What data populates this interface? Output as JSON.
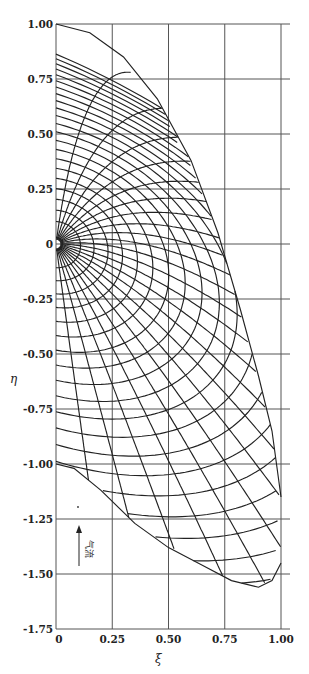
{
  "chart_data": {
    "type": "line",
    "title": "",
    "xlabel": "ξ",
    "ylabel": "η",
    "xlim": [
      0,
      1.0
    ],
    "ylim": [
      -1.75,
      1.0
    ],
    "grid": true,
    "x_ticks": [
      "0",
      "0.25",
      "0.50",
      "0.75",
      "1.00"
    ],
    "x_tick_values": [
      0,
      0.25,
      0.5,
      0.75,
      1.0
    ],
    "y_ticks": [
      "1.00",
      "0.75",
      "0.50",
      "0.25",
      "0",
      "-0.25",
      "-0.50",
      "-0.75",
      "-1.00",
      "-1.25",
      "-1.50",
      "-1.75"
    ],
    "y_tick_values": [
      1.0,
      0.75,
      0.5,
      0.25,
      0,
      -0.25,
      -0.5,
      -0.75,
      -1.0,
      -1.25,
      -1.5,
      -1.75
    ],
    "annotation": {
      "text": "气流",
      "meaning": "airflow direction (upward arrow)",
      "x": 0.05,
      "y": -1.38
    },
    "series": [
      {
        "name": "outer-boundary",
        "points": [
          [
            0,
            1.0
          ],
          [
            0.15,
            0.96
          ],
          [
            0.3,
            0.85
          ],
          [
            0.45,
            0.66
          ],
          [
            0.6,
            0.38
          ],
          [
            0.72,
            0.05
          ],
          [
            0.82,
            -0.3
          ],
          [
            0.9,
            -0.6
          ],
          [
            0.96,
            -0.85
          ],
          [
            1.0,
            -1.15
          ]
        ]
      },
      {
        "name": "lower-boundary",
        "points": [
          [
            0,
            -1.0
          ],
          [
            0.08,
            -1.02
          ],
          [
            0.2,
            -1.12
          ],
          [
            0.35,
            -1.27
          ],
          [
            0.5,
            -1.38
          ],
          [
            0.65,
            -1.46
          ],
          [
            0.78,
            -1.53
          ],
          [
            0.9,
            -1.56
          ],
          [
            0.96,
            -1.53
          ],
          [
            1.0,
            -1.45
          ]
        ]
      }
    ]
  },
  "axes": {
    "y_label": "η",
    "x_label": "ξ"
  }
}
